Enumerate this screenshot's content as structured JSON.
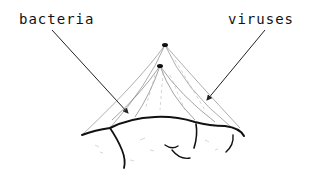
{
  "diagram": {
    "labels": {
      "bacteria": "bacteria",
      "viruses": "viruses"
    },
    "colors": {
      "ink": "#111111",
      "background": "#ffffff"
    }
  }
}
